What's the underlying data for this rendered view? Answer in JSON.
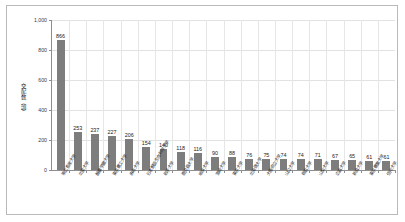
{
  "chart_data": {
    "type": "bar",
    "title": "",
    "subtitle": "",
    "xlabel": "",
    "ylabel": "交配数（頭）",
    "ylim": [
      0,
      1000
    ],
    "ytick_values": [
      0,
      200,
      400,
      600,
      800,
      1000
    ],
    "ytick_labels": [
      "0",
      "200",
      "400",
      "600",
      "800",
      "1,000"
    ],
    "grid": "both",
    "legend": "none",
    "bar_color": "#7d7d7d",
    "show_value_labels": true,
    "categories": [
      "帯広畜産大学",
      "北里大学",
      "酪農学園大学",
      "東京農工大学",
      "麻布大学",
      "日本獣医生命科学大学",
      "岩手大学",
      "鹿児島大学",
      "岐阜大学",
      "宮崎大学",
      "東京大学",
      "北海道大学",
      "大阪府立大学",
      "山口大学",
      "鳥取大学",
      "山梨大学",
      "広島大学",
      "新潟大学",
      "東京農業大学",
      "信州大学"
    ],
    "values": [
      866,
      253,
      237,
      227,
      206,
      154,
      140,
      118,
      116,
      90,
      88,
      76,
      75,
      74,
      74,
      71,
      67,
      65,
      61,
      61
    ],
    "value_labels": [
      "866",
      "253",
      "237",
      "227",
      "206",
      "154",
      "140",
      "118",
      "116",
      "90",
      "88",
      "76",
      "75",
      "74",
      "74",
      "71",
      "67",
      "65",
      "61",
      "61"
    ]
  }
}
